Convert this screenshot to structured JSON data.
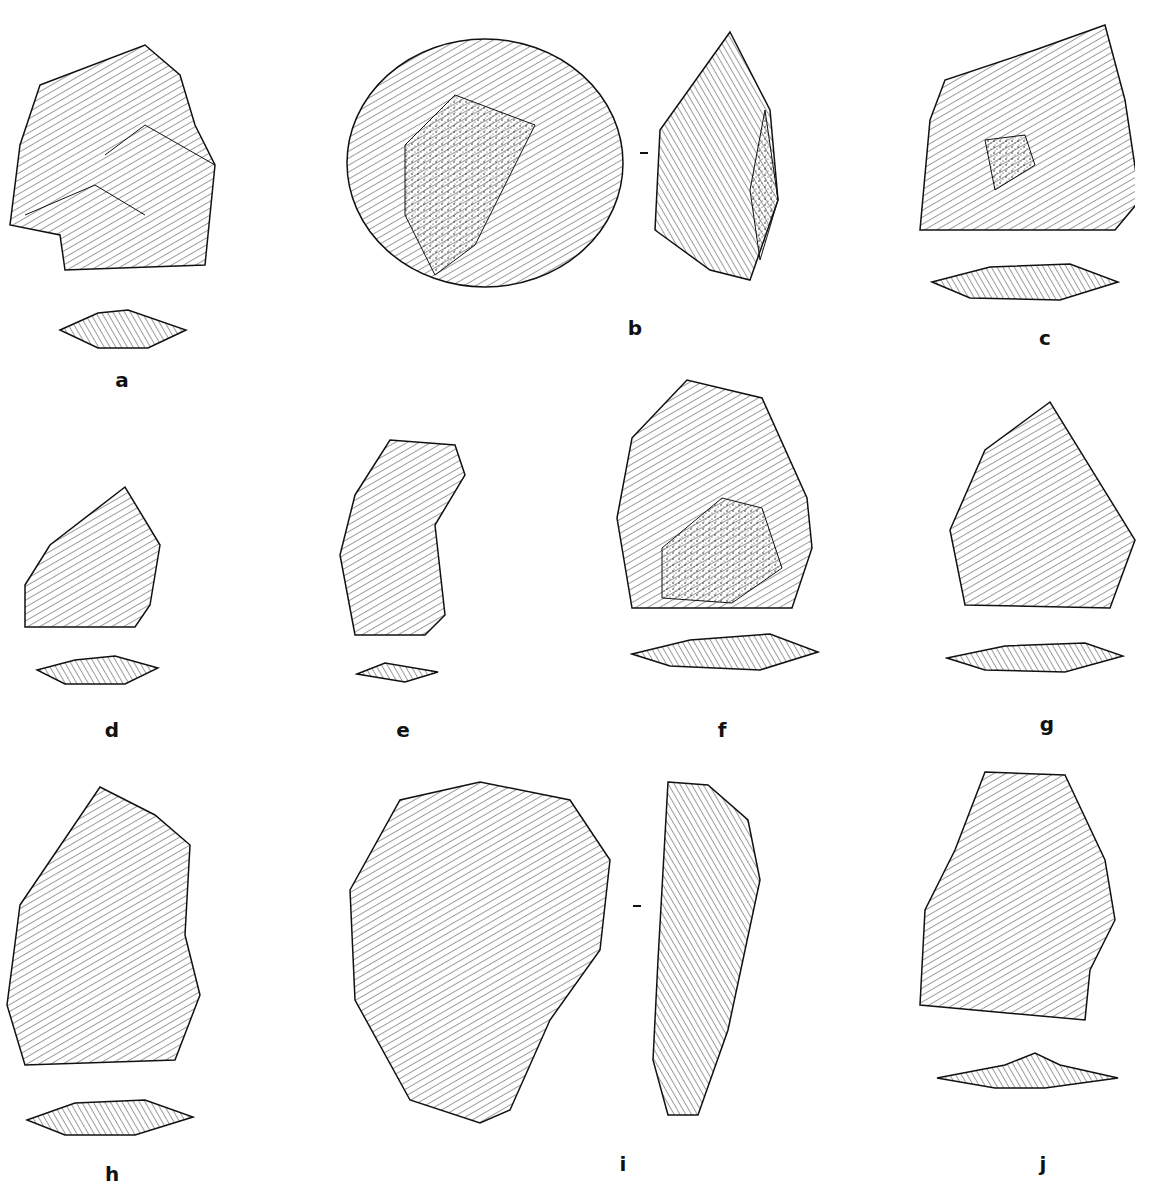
{
  "plate": {
    "subject": "Stone tool (lithic artifact) illustrations",
    "background": "#ffffff",
    "ink": "#111111"
  },
  "artifacts": [
    {
      "label": "a",
      "views": [
        "face",
        "section"
      ]
    },
    {
      "label": "b",
      "views": [
        "face",
        "profile"
      ]
    },
    {
      "label": "c",
      "views": [
        "face",
        "section"
      ]
    },
    {
      "label": "d",
      "views": [
        "face",
        "section"
      ]
    },
    {
      "label": "e",
      "views": [
        "face",
        "section"
      ]
    },
    {
      "label": "f",
      "views": [
        "face",
        "section"
      ]
    },
    {
      "label": "g",
      "views": [
        "face",
        "section"
      ]
    },
    {
      "label": "h",
      "views": [
        "face",
        "section"
      ]
    },
    {
      "label": "i",
      "views": [
        "face",
        "profile"
      ]
    },
    {
      "label": "j",
      "views": [
        "face",
        "section"
      ]
    }
  ]
}
